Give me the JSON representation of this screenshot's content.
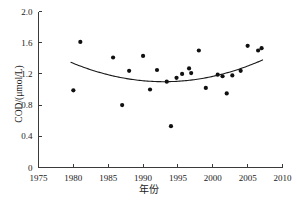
{
  "chart_data": {
    "type": "scatter",
    "title": "",
    "xlabel": "年份",
    "ylabel": "COD/(μmol/L)",
    "xlim": [
      1975,
      2010
    ],
    "ylim": [
      0,
      2.0
    ],
    "xticks": [
      1975,
      1980,
      1985,
      1990,
      1995,
      2000,
      2005,
      2010
    ],
    "xtick_labels": [
      "1975",
      "1980",
      "1985",
      "1990",
      "1995",
      "2000",
      "2005",
      "2010"
    ],
    "yticks": [
      0,
      0.4,
      0.8,
      1.2,
      1.6,
      2.0
    ],
    "ytick_labels": [
      "0",
      "0.4",
      "0.8",
      "1.2",
      "1.6",
      "2.0"
    ],
    "grid": false,
    "legend": null,
    "marker_color": "#101010",
    "curve_color": "#1a1a1a",
    "axis_color": "#3a3a3a",
    "points": [
      {
        "x": 1980.0,
        "y": 0.99
      },
      {
        "x": 1981.0,
        "y": 1.61
      },
      {
        "x": 1985.7,
        "y": 1.41
      },
      {
        "x": 1987.0,
        "y": 0.8
      },
      {
        "x": 1988.0,
        "y": 1.24
      },
      {
        "x": 1990.0,
        "y": 1.43
      },
      {
        "x": 1991.0,
        "y": 1.0
      },
      {
        "x": 1992.0,
        "y": 1.25
      },
      {
        "x": 1993.4,
        "y": 1.1
      },
      {
        "x": 1994.0,
        "y": 0.53
      },
      {
        "x": 1994.8,
        "y": 1.15
      },
      {
        "x": 1995.6,
        "y": 1.2
      },
      {
        "x": 1996.6,
        "y": 1.27
      },
      {
        "x": 1996.9,
        "y": 1.21
      },
      {
        "x": 1998.0,
        "y": 1.5
      },
      {
        "x": 1999.0,
        "y": 1.02
      },
      {
        "x": 2000.7,
        "y": 1.19
      },
      {
        "x": 2001.4,
        "y": 1.17
      },
      {
        "x": 2002.0,
        "y": 0.95
      },
      {
        "x": 2002.8,
        "y": 1.18
      },
      {
        "x": 2004.0,
        "y": 1.24
      },
      {
        "x": 2005.0,
        "y": 1.56
      },
      {
        "x": 2006.5,
        "y": 1.5
      },
      {
        "x": 2007.0,
        "y": 1.53
      }
    ],
    "trend": {
      "label": "quadratic-fit",
      "vertex_x": 1993.0,
      "vertex_y": 1.1,
      "x_start": 1979.6,
      "y_start": 1.35,
      "x_end": 2007.2,
      "y_end": 1.44
    }
  }
}
